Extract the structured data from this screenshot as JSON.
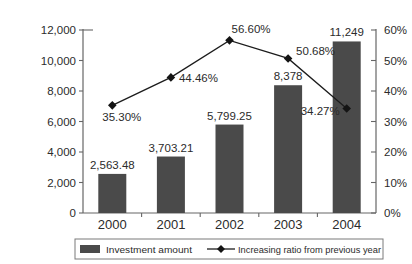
{
  "chart_data": {
    "type": "bar",
    "subtype": "bar-line-combo",
    "title": "",
    "categories": [
      "2000",
      "2001",
      "2002",
      "2003",
      "2004"
    ],
    "series": [
      {
        "name": "Investment amount",
        "type": "bar",
        "axis": "left",
        "values": [
          2563.48,
          3703.21,
          5799.25,
          8378,
          11249
        ],
        "labels": [
          "2,563.48",
          "3,703.21",
          "5,799.25",
          "8,378",
          "11,249"
        ]
      },
      {
        "name": "Increasing ratio from previous year",
        "type": "line",
        "axis": "right",
        "marker": "diamond",
        "values": [
          35.3,
          44.46,
          56.6,
          50.68,
          34.27
        ],
        "labels": [
          "35.30%",
          "44.46%",
          "56.60%",
          "50.68%",
          "34.27%"
        ]
      }
    ],
    "left_axis": {
      "min": 0,
      "max": 12000,
      "step": 2000,
      "tick_labels": [
        "0",
        "2,000",
        "4,000",
        "6,000",
        "8,000",
        "10,000",
        "12,000"
      ]
    },
    "right_axis": {
      "min": 0,
      "max": 60,
      "step": 10,
      "tick_labels": [
        "0%",
        "10%",
        "20%",
        "30%",
        "40%",
        "50%",
        "60%"
      ]
    },
    "grid": false,
    "legend": {
      "position": "bottom",
      "items": [
        {
          "label": "Investment amount",
          "swatch": "bar"
        },
        {
          "label": "Increasing ratio from previous year",
          "swatch": "line-diamond"
        }
      ]
    },
    "colors": {
      "bar": "#4a4a4a",
      "line": "#1c1c1c",
      "marker": "#141414",
      "text": "#2b2b2b",
      "axis": "#666666",
      "legend_border": "#7a7a7a",
      "background": "#ffffff"
    }
  }
}
